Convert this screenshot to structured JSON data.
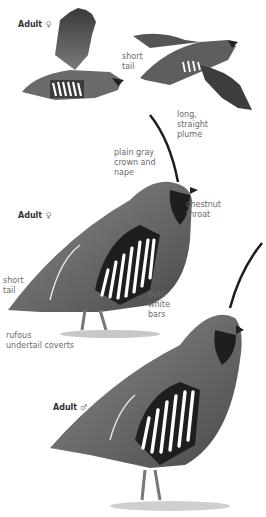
{
  "plate": {
    "subject": "Mountain Quail",
    "figures": [
      {
        "id": "flying-female",
        "label": "Adult",
        "sex_symbol": "♀"
      },
      {
        "id": "flying-other",
        "label": ""
      },
      {
        "id": "standing-female",
        "label": "Adult",
        "sex_symbol": "♀"
      },
      {
        "id": "standing-male",
        "label": "Adult",
        "sex_symbol": "♂"
      }
    ],
    "annotations": {
      "short_tail_top": "short\ntail",
      "plume": "long,\nstraight\nplume",
      "crown": "plain gray\ncrown and\nnape",
      "throat": "chestnut\nthroat",
      "short_tail_mid": "short\ntail",
      "bars": "bold\nwhite\nbars",
      "undertail": "rufous\nundertail coverts"
    },
    "colors": {
      "background": "#ffffff",
      "body_gray": "#6e6e6e",
      "dark": "#1e1e1e",
      "bar_white": "#ffffff",
      "label_text": "#6a6a6a"
    }
  }
}
